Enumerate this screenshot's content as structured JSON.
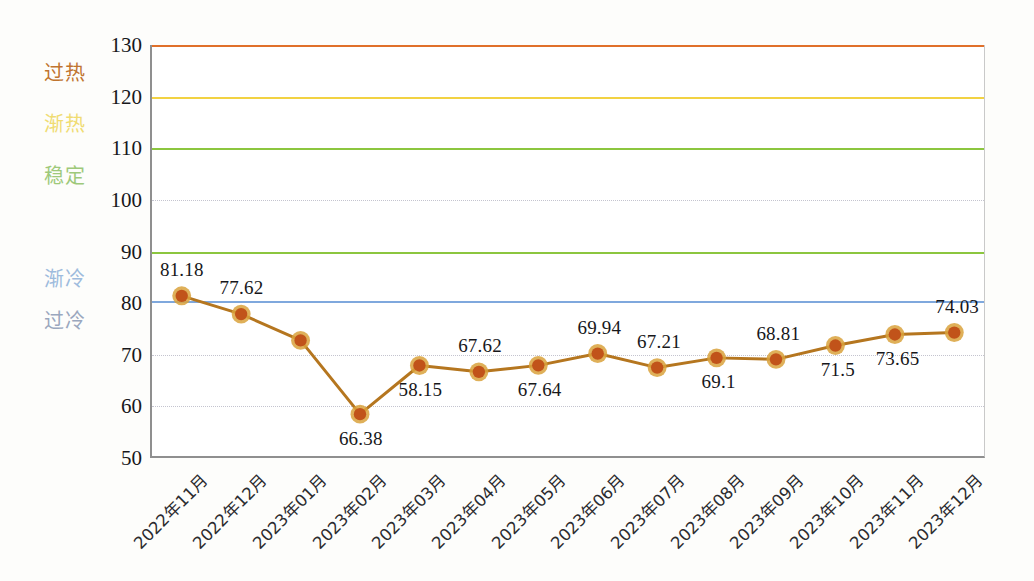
{
  "chart_data": {
    "type": "line",
    "title": "",
    "subtitle": "",
    "xlabel": "",
    "ylabel": "",
    "ylim": [
      50,
      130
    ],
    "y_ticks": [
      50,
      60,
      70,
      80,
      90,
      100,
      110,
      120,
      130
    ],
    "grid": "horizontal dotted gridlines at 60, 70, 100",
    "gridlines": [
      60,
      70,
      100
    ],
    "legend_position": "none",
    "categories": [
      "2022年11月",
      "2022年12月",
      "2023年01月",
      "2023年02月",
      "2023年03月",
      "2023年04月",
      "2023年05月",
      "2023年06月",
      "2023年07月",
      "2023年08月",
      "2023年09月",
      "2023年10月",
      "2023年11月",
      "2023年12月"
    ],
    "series": [
      {
        "name": "指数",
        "color": "#b5761f",
        "marker_color": "#c1531a",
        "marker_ring_color": "#d9a23c",
        "values": [
          81.18,
          77.62,
          72.5,
          58.15,
          67.62,
          66.38,
          67.64,
          69.94,
          67.21,
          69.1,
          68.81,
          71.5,
          73.65,
          74.03
        ]
      }
    ],
    "point_labels": [
      {
        "text": "81.18",
        "value": 81.18,
        "position": "above"
      },
      {
        "text": "77.62",
        "value": 77.62,
        "position": "above"
      },
      {
        "text": "",
        "value": 72.5,
        "position": "none"
      },
      {
        "text": "66.38",
        "value": 58.15,
        "position": "below"
      },
      {
        "text": "58.15",
        "value": 67.62,
        "position": "below"
      },
      {
        "text": "67.62",
        "value": 66.38,
        "position": "above"
      },
      {
        "text": "67.64",
        "value": 67.64,
        "position": "below"
      },
      {
        "text": "69.94",
        "value": 69.94,
        "position": "above"
      },
      {
        "text": "67.21",
        "value": 67.21,
        "position": "above"
      },
      {
        "text": "69.1",
        "value": 69.1,
        "position": "below"
      },
      {
        "text": "68.81",
        "value": 68.81,
        "position": "above"
      },
      {
        "text": "71.5",
        "value": 71.5,
        "position": "below"
      },
      {
        "text": "73.65",
        "value": 73.65,
        "position": "below"
      },
      {
        "text": "74.03",
        "value": 74.03,
        "position": "above"
      }
    ],
    "threshold_lines": [
      {
        "label": "过热",
        "value": 130,
        "color": "#e0702a",
        "label_color": "#c0742f"
      },
      {
        "label": "渐热",
        "value": 120,
        "color": "#f2d243",
        "label_color": "#f0dc72"
      },
      {
        "label": "稳定",
        "value": 110,
        "color": "#8cc63f",
        "label_color": "#9ec97a"
      },
      {
        "label": "",
        "value": 90,
        "color": "#8cc63f",
        "label_color": "#8cc63f"
      },
      {
        "label": "渐冷",
        "value": 80.5,
        "color": "#7fa8dd",
        "label_color": "#9dbbdd"
      },
      {
        "label": "过冷",
        "value": 75,
        "color": "",
        "label_color": "#9aa7be"
      }
    ]
  }
}
